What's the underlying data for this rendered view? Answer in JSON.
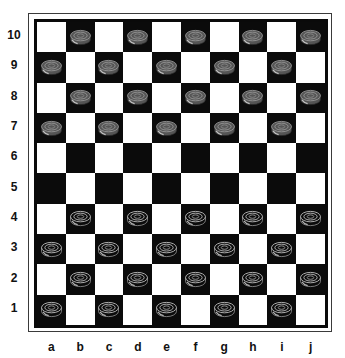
{
  "board": {
    "size": 10,
    "rows": [
      "10",
      "9",
      "8",
      "7",
      "6",
      "5",
      "4",
      "3",
      "2",
      "1"
    ],
    "columns": [
      "a",
      "b",
      "c",
      "d",
      "e",
      "f",
      "g",
      "h",
      "i",
      "j"
    ],
    "colors": {
      "light_square": "#ffffff",
      "dark_square": "#0b0b0b",
      "frame": "#3a3a3a",
      "border": "#0a0a0a"
    }
  },
  "pieces": {
    "grey": {
      "label": "grey-piece",
      "color": "#555555",
      "ring_color": "#9a9a9a",
      "squares": [
        "b10",
        "d10",
        "f10",
        "h10",
        "j10",
        "a9",
        "c9",
        "e9",
        "g9",
        "i9",
        "b8",
        "d8",
        "f8",
        "h8",
        "j8",
        "a7",
        "c7",
        "e7",
        "g7",
        "i7"
      ]
    },
    "black": {
      "label": "black-piece",
      "color": "#0b0b0b",
      "ring_color": "#c8c8c8",
      "squares": [
        "b4",
        "d4",
        "f4",
        "h4",
        "j4",
        "a3",
        "c3",
        "e3",
        "g3",
        "i3",
        "b2",
        "d2",
        "f2",
        "h2",
        "j2",
        "a1",
        "c1",
        "e1",
        "g1",
        "i1"
      ]
    }
  }
}
